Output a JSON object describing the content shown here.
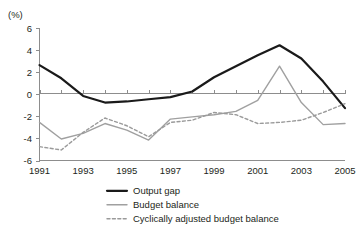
{
  "chart_data": {
    "type": "line",
    "title": "",
    "subtitle": "",
    "unit_label": "(%)",
    "xlabel": "",
    "ylabel": "",
    "x": [
      1991,
      1992,
      1993,
      1994,
      1995,
      1996,
      1997,
      1998,
      1999,
      2000,
      2001,
      2002,
      2003,
      2004,
      2005
    ],
    "xtick_labels": [
      "1991",
      "",
      "1993",
      "",
      "1995",
      "",
      "1997",
      "",
      "1999",
      "",
      "2001",
      "",
      "2003",
      "",
      "2005"
    ],
    "xtick_labels_shown": [
      "1991",
      "1993",
      "1995",
      "1997",
      "1999",
      "2001",
      "2003",
      "2005"
    ],
    "ytick_labels": [
      "6",
      "4",
      "2",
      "0",
      "-2",
      "-4",
      "-6"
    ],
    "ytick_values": [
      6,
      4,
      2,
      0,
      -2,
      -4,
      -6
    ],
    "ylim": [
      -6,
      6
    ],
    "xlim": [
      1991,
      2005
    ],
    "grid": false,
    "zero_line": true,
    "legend_position": "bottom",
    "series": [
      {
        "name": "Output gap",
        "style": "solid",
        "color": "#1a1a1a",
        "width": 2.2,
        "values": [
          2.7,
          1.5,
          -0.1,
          -0.7,
          -0.6,
          -0.4,
          -0.2,
          0.3,
          1.6,
          2.6,
          3.6,
          4.5,
          3.3,
          1.2,
          -1.2
        ]
      },
      {
        "name": "Budget balance",
        "style": "solid",
        "color": "#a0a0a0",
        "width": 1.4,
        "values": [
          -2.5,
          -4.0,
          -3.5,
          -2.6,
          -3.2,
          -4.1,
          -2.2,
          -2.0,
          -1.8,
          -1.5,
          -0.5,
          2.6,
          -0.7,
          -2.7,
          -2.6
        ]
      },
      {
        "name": "Cyclically adjusted budget balance",
        "style": "dashed",
        "color": "#9a9a9a",
        "width": 1.4,
        "values": [
          -4.7,
          -5.0,
          -3.4,
          -2.1,
          -2.8,
          -3.8,
          -2.5,
          -2.3,
          -1.6,
          -1.8,
          -2.6,
          -2.5,
          -2.3,
          -1.6,
          -0.8
        ]
      }
    ]
  },
  "legend": {
    "items": [
      {
        "label": "Output gap"
      },
      {
        "label": "Budget balance"
      },
      {
        "label": "Cyclically adjusted budget balance"
      }
    ]
  }
}
